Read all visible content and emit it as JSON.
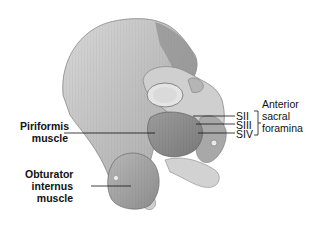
{
  "figure": {
    "colors": {
      "bone_light": "#e6e6e6",
      "bone_mid": "#c8c8c8",
      "bone_dark": "#9a9a9a",
      "muscle": "#8f8f8f",
      "muscle_dark": "#6e6e6e",
      "leader_line": "#111111"
    }
  },
  "labels": {
    "piriformis": {
      "line1": "Piriformis",
      "line2": "muscle"
    },
    "obturator": {
      "line1": "Obturator",
      "line2": "internus",
      "line3": "muscle"
    },
    "sacral_levels": [
      "SII",
      "SIII",
      "SIV"
    ],
    "foramina": {
      "line1": "Anterior",
      "line2": "sacral",
      "line3": "foramina"
    }
  }
}
